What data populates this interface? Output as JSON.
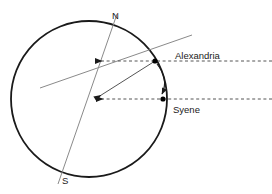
{
  "figure": {
    "background_color": "#ffffff",
    "width": 272,
    "height": 194
  },
  "labels": {
    "north_pole": "N",
    "south_pole": "S",
    "city_alexandria": "Alexandria",
    "city_syene": "Syene"
  },
  "colors": {
    "earth_outline": "#1a1a1a",
    "axis_line": "#7a7a7a",
    "sun_ray": "#7a7a7a",
    "dashed_ray": "#555555",
    "angle_arc": "#1a1a1a",
    "city_dot": "#000000",
    "text": "#1a1a1a"
  },
  "geometry": {
    "earth": {
      "cx": 89,
      "cy": 99,
      "r": 78,
      "stroke_width": 1.8
    },
    "polar_axis": {
      "x1": 117,
      "y1": 14,
      "x2": 58,
      "y2": 184
    },
    "alexandria_point": {
      "x": 155,
      "y": 61
    },
    "syene_point": {
      "x": 163,
      "y": 99
    },
    "center_vertex": {
      "x": 95,
      "y": 99
    },
    "sun_ray_through_alexandria": {
      "x1": 40,
      "y1": 88,
      "x2": 192,
      "y2": 35
    },
    "dashed_ray_alexandria": {
      "x1": 93,
      "y1": 61,
      "x2": 272,
      "y2": 61
    },
    "dashed_ray_syene": {
      "x1": 94,
      "y1": 99,
      "x2": 272,
      "y2": 99
    },
    "radius_to_alexandria": {
      "x1": 95,
      "y1": 99,
      "x2": 155,
      "y2": 61
    },
    "angle_arc": {
      "from_x": 157,
      "from_y": 63,
      "to_x": 162,
      "to_y": 95,
      "bulge": 8
    }
  },
  "label_positions": {
    "north_pole": {
      "x": 112,
      "y": 19
    },
    "south_pole": {
      "x": 62,
      "y": 184
    },
    "alexandria": {
      "x": 175,
      "y": 59
    },
    "syene": {
      "x": 173,
      "y": 113
    }
  }
}
